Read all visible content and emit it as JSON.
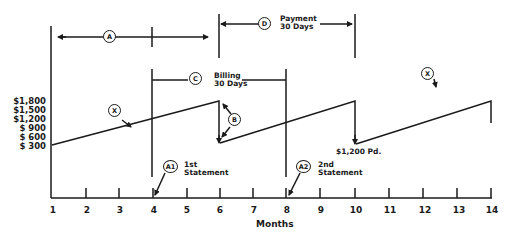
{
  "diagram": {
    "x_axis": {
      "label": "Months",
      "ticks": [
        "1",
        "2",
        "3",
        "4",
        "5",
        "6",
        "7",
        "8",
        "9",
        "10",
        "11",
        "12",
        "13",
        "14"
      ]
    },
    "y_axis": {
      "ticks": [
        "$1,800",
        "$1,500",
        "$1,200",
        "$ 900",
        "$ 600",
        "$ 300"
      ]
    },
    "callouts": {
      "A": "A",
      "A1": "A1",
      "A2": "A2",
      "B": "B",
      "C": "C",
      "D": "D",
      "X": "X"
    },
    "annotations": {
      "billing": "Billing\n30 Days",
      "payment": "Payment\n30 Days",
      "first_statement": "1st\nStatement",
      "second_statement": "2nd\nStatement",
      "paid": "$1,200 Pd."
    },
    "line_color": "#1a1a1a",
    "sawtooth": [
      {
        "month": 1,
        "balance_level": "low"
      },
      {
        "month": 6,
        "balance_level": "$1,800 peak"
      },
      {
        "month": 6,
        "balance_level": "drop after payment"
      },
      {
        "month": 10,
        "balance_level": "$1,800 peak"
      },
      {
        "month": 10,
        "balance_level": "$1,200 Pd. drop"
      },
      {
        "month": 14,
        "balance_level": "$1,800 peak"
      }
    ]
  }
}
